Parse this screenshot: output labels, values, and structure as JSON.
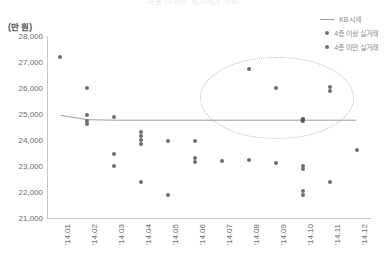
{
  "chart_data": {
    "type": "scatter",
    "title": "서울 아파트 실거래가 추이",
    "xlabel": "",
    "ylabel": "",
    "y_unit_label": "(만 원)",
    "ylim": [
      21000,
      28000
    ],
    "yticks": [
      "28,000",
      "27,000",
      "26,000",
      "25,000",
      "24,000",
      "23,000",
      "22,000",
      "21,000"
    ],
    "ytick_values": [
      28000,
      27000,
      26000,
      25000,
      24000,
      23000,
      22000,
      21000
    ],
    "categories": [
      "'14.01",
      "'14.02",
      "'14.03",
      "'14.04",
      "'14.05",
      "'14.06",
      "'14.07",
      "'14.08",
      "'14.09",
      "'14.10",
      "'14.11",
      "'14.12"
    ],
    "grid": false,
    "legend_position": "top-right",
    "series": [
      {
        "name": "KB시세",
        "type": "line",
        "color": "#9a9aa2",
        "x": [
          "'14.01",
          "'14.02",
          "'14.03",
          "'14.04",
          "'14.05",
          "'14.06",
          "'14.07",
          "'14.08",
          "'14.09",
          "'14.10",
          "'14.11",
          "'14.12"
        ],
        "values": [
          24950,
          24780,
          24760,
          24760,
          24760,
          24760,
          24760,
          24760,
          24760,
          24760,
          24760,
          24760
        ]
      },
      {
        "name": "4층 이상 실거래",
        "type": "scatter",
        "color": "#6d6d78",
        "points": [
          {
            "x": "'14.01",
            "y": 27200
          },
          {
            "x": "'14.02",
            "y": 26000
          },
          {
            "x": "'14.02",
            "y": 24950
          },
          {
            "x": "'14.02",
            "y": 24750
          },
          {
            "x": "'14.03",
            "y": 24900
          },
          {
            "x": "'14.08",
            "y": 26750
          },
          {
            "x": "'14.09",
            "y": 26000
          },
          {
            "x": "'14.10",
            "y": 24800
          },
          {
            "x": "'14.11",
            "y": 26050
          },
          {
            "x": "'14.11",
            "y": 25900
          }
        ]
      },
      {
        "name": "4층 미만 실거래",
        "type": "scatter",
        "color": "#6d6d78",
        "points": [
          {
            "x": "'14.02",
            "y": 24600
          },
          {
            "x": "'14.03",
            "y": 23450
          },
          {
            "x": "'14.03",
            "y": 23000
          },
          {
            "x": "'14.04",
            "y": 24300
          },
          {
            "x": "'14.04",
            "y": 24150
          },
          {
            "x": "'14.04",
            "y": 24000
          },
          {
            "x": "'14.04",
            "y": 23850
          },
          {
            "x": "'14.04",
            "y": 22400
          },
          {
            "x": "'14.05",
            "y": 23950
          },
          {
            "x": "'14.05",
            "y": 21900
          },
          {
            "x": "'14.06",
            "y": 23950
          },
          {
            "x": "'14.06",
            "y": 23300
          },
          {
            "x": "'14.06",
            "y": 23150
          },
          {
            "x": "'14.07",
            "y": 23200
          },
          {
            "x": "'14.08",
            "y": 23250
          },
          {
            "x": "'14.09",
            "y": 23100
          },
          {
            "x": "'14.10",
            "y": 23000
          },
          {
            "x": "'14.10",
            "y": 22900
          },
          {
            "x": "'14.10",
            "y": 22050
          },
          {
            "x": "'14.10",
            "y": 21900
          },
          {
            "x": "'14.11",
            "y": 22400
          },
          {
            "x": "'14.12",
            "y": 23600
          }
        ]
      }
    ],
    "annotations": [
      {
        "type": "ellipse",
        "style": "dotted",
        "color": "#b9b2c9",
        "x_range": [
          "'14.07",
          "'14.11"
        ],
        "y_range": [
          24250,
          27050
        ],
        "note": "고층 실거래 고가 구간 강조"
      }
    ]
  },
  "legend": {
    "items": [
      {
        "label": "KB시세",
        "marker": "line"
      },
      {
        "label": "4층 이상 실거래",
        "marker": "dot"
      },
      {
        "label": "4층 미만 실거래",
        "marker": "dot"
      }
    ]
  }
}
